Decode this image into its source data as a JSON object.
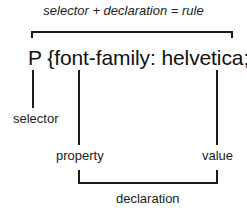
{
  "diagram": {
    "title": "selector + declaration = rule",
    "rule_text": "P {font-family: helvetica;}",
    "labels": {
      "selector": "selector",
      "property": "property",
      "value": "value",
      "declaration": "declaration"
    }
  }
}
